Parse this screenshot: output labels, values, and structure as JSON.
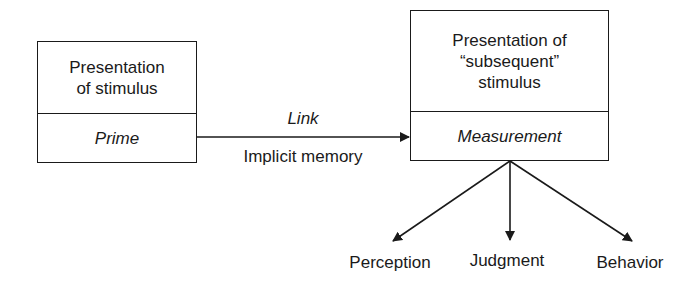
{
  "diagram": {
    "left_box": {
      "top_text": "Presentation of stimulus",
      "top_lines": [
        "Presentation",
        "of stimulus"
      ],
      "bottom_text": "Prime"
    },
    "right_box": {
      "top_text": "Presentation of “subsequent” stimulus",
      "top_lines": [
        "Presentation of",
        "“subsequent”",
        "stimulus"
      ],
      "bottom_text": "Measurement"
    },
    "link_arrow": {
      "label_above": "Link",
      "label_below": "Implicit memory"
    },
    "outcomes": [
      {
        "label": "Perception"
      },
      {
        "label": "Judgment"
      },
      {
        "label": "Behavior"
      }
    ],
    "colors": {
      "stroke": "#1a1a1a",
      "background": "#ffffff"
    }
  }
}
